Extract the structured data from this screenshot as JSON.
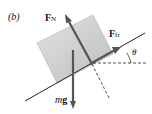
{
  "panel_label": "(b)",
  "forces": {
    "normal": {
      "symbol": "F",
      "subscript": "N"
    },
    "friction": {
      "symbol": "F",
      "subscript": "fr"
    },
    "gravity": {
      "m": "m",
      "g": "g"
    }
  },
  "angle_label": "θ",
  "colors": {
    "block": "#c9c9c9",
    "arrow": "#555555",
    "line": "#222222"
  }
}
